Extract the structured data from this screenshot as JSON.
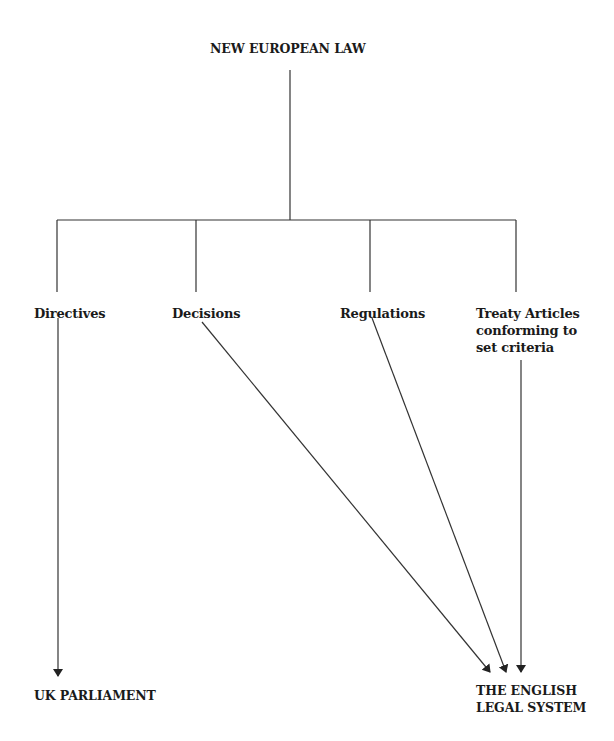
{
  "diagram": {
    "root": {
      "label": "NEW EUROPEAN LAW"
    },
    "sources": [
      {
        "id": "directives",
        "label": "Directives",
        "target": "uk_parliament"
      },
      {
        "id": "decisions",
        "label": "Decisions",
        "target": "english_legal_system"
      },
      {
        "id": "regulations",
        "label": "Regulations",
        "target": "english_legal_system"
      },
      {
        "id": "treaty",
        "label_lines": [
          "Treaty Articles",
          "conforming to",
          "set criteria"
        ],
        "target": "english_legal_system"
      }
    ],
    "targets": {
      "uk_parliament": {
        "label": "UK PARLIAMENT"
      },
      "english_legal_system": {
        "label_lines": [
          "THE ENGLISH",
          "LEGAL SYSTEM"
        ]
      }
    },
    "line_color": "#222222"
  }
}
